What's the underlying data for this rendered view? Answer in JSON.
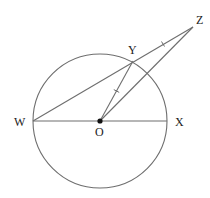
{
  "diagram": {
    "type": "circle-geometry",
    "colors": {
      "line": "#6e6e6e",
      "text": "#222222",
      "point": "#111111",
      "background": "#ffffff"
    },
    "circle": {
      "center": "O",
      "cx": 100,
      "cy": 121,
      "r": 67
    },
    "points": {
      "W": {
        "label": "W",
        "x": 33,
        "y": 121,
        "label_x": 14,
        "label_y": 126
      },
      "O": {
        "label": "O",
        "x": 100,
        "y": 121,
        "label_x": 95,
        "label_y": 136
      },
      "X": {
        "label": "X",
        "x": 167,
        "y": 121,
        "label_x": 175,
        "label_y": 126
      },
      "Y": {
        "label": "Y",
        "x": 133,
        "y": 61,
        "label_x": 128,
        "label_y": 54
      },
      "Z": {
        "label": "Z",
        "x": 193,
        "y": 27,
        "label_x": 196,
        "label_y": 24
      }
    },
    "segments": [
      {
        "name": "WX",
        "from": "W",
        "to": "X",
        "note": "diameter"
      },
      {
        "name": "WZ",
        "from": "W",
        "to": "Z",
        "note": "secant through Y"
      },
      {
        "name": "OY",
        "from": "O",
        "to": "Y",
        "note": "radius, tick-marked"
      },
      {
        "name": "OZ",
        "from": "O",
        "to": "Z"
      }
    ],
    "congruence_marks": [
      {
        "segment": "YZ",
        "ticks": 1
      },
      {
        "segment": "OY",
        "ticks": 1
      }
    ],
    "labels": [
      "W",
      "O",
      "X",
      "Y",
      "Z"
    ]
  }
}
